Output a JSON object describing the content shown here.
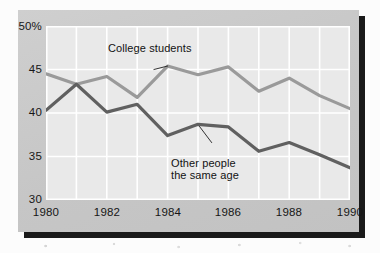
{
  "chart_data": {
    "type": "line",
    "title": "",
    "subtitle": "",
    "xlabel": "",
    "ylabel": "",
    "xlim": [
      1980,
      1990
    ],
    "ylim": [
      30,
      50
    ],
    "grid": true,
    "legend_position": "inline-annotations",
    "x": [
      1980,
      1981,
      1982,
      1983,
      1984,
      1985,
      1986,
      1987,
      1988,
      1989,
      1990
    ],
    "series": [
      {
        "name": "College students",
        "color": "#9a9a9a",
        "values": [
          44.5,
          43.3,
          44.2,
          41.8,
          45.4,
          44.4,
          45.3,
          42.5,
          44.0,
          42.0,
          40.5
        ]
      },
      {
        "name": "Other people the same age",
        "color": "#606060",
        "values": [
          40.3,
          43.3,
          40.1,
          41.0,
          37.4,
          38.7,
          38.4,
          35.6,
          36.6,
          35.2,
          33.7
        ]
      }
    ],
    "y_ticks": [
      {
        "value": 50,
        "label": "50%"
      },
      {
        "value": 45,
        "label": "45"
      },
      {
        "value": 40,
        "label": "40"
      },
      {
        "value": 35,
        "label": "35"
      },
      {
        "value": 30,
        "label": "30"
      }
    ],
    "x_ticks": [
      {
        "value": 1980,
        "label": "1980"
      },
      {
        "value": 1982,
        "label": "1982"
      },
      {
        "value": 1984,
        "label": "1984"
      },
      {
        "value": 1986,
        "label": "1986"
      },
      {
        "value": 1988,
        "label": "1988"
      },
      {
        "value": 1990,
        "label": "1990"
      }
    ],
    "annotations": [
      {
        "id": "college-students",
        "text": "College students",
        "line_from": [
          1983.55,
          45.0
        ],
        "line_to": [
          1984.0,
          45.4
        ]
      },
      {
        "id": "other-people",
        "text": "Other people\nthe same age",
        "text_line1": "Other people",
        "text_line2": "the same age",
        "line_from": [
          1985.45,
          36.6
        ],
        "line_to": [
          1985.05,
          38.45
        ]
      }
    ]
  },
  "annotations": {
    "college_students": "College students",
    "other_people_line1": "Other people",
    "other_people_line2": "the same age"
  },
  "colors": {
    "panel": "#c9c9c9",
    "plot_background": "#e9e9e9",
    "gridline": "#ffffff",
    "shadow": "#1a1a1a",
    "series_college": "#9a9a9a",
    "series_other": "#606060",
    "text": "#161616"
  }
}
